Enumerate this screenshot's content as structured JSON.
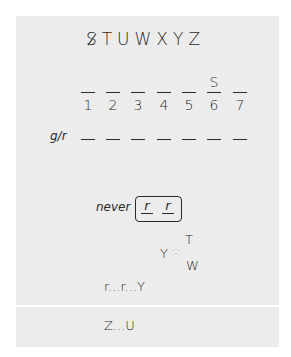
{
  "letters": {
    "crossed": "S",
    "rest": "TUWXYZ"
  },
  "positions": {
    "numbers": [
      "1",
      "2",
      "3",
      "4",
      "5",
      "6",
      "7"
    ],
    "values": [
      "",
      "",
      "",
      "",
      "",
      "S",
      ""
    ]
  },
  "gr_row": {
    "label": "g/r",
    "slots": 7
  },
  "never": {
    "label": "never",
    "slots": [
      "r",
      "r"
    ]
  },
  "wedge": {
    "left": "Y",
    "top": "T",
    "bottom": "W"
  },
  "chain1": "r...r...Y",
  "chain2": "Z...U"
}
